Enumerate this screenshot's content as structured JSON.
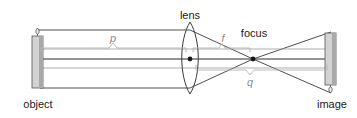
{
  "figure": {
    "type": "optics-ray-diagram",
    "width": 357,
    "height": 118,
    "background_color": "#ffffff"
  },
  "labels": {
    "lens": "lens",
    "focus": "focus",
    "object": "object",
    "image": "image",
    "object_distance": "p",
    "focal_length": "f",
    "image_distance": "q"
  },
  "colors": {
    "ray_line": "#3a3a3a",
    "optical_axis": "#2b2b2b",
    "candle_body_light": "#d9d9d9",
    "candle_body_dark": "#a8a8a8",
    "candle_outline": "#555555",
    "lens_outline": "#3a3a3a",
    "brace_gray": "#b3b3b3",
    "dim_text": "#8c8c8c",
    "label_text": "#1a1a1a",
    "node_dot": "#1a1a1a"
  },
  "geometry": {
    "optical_axis_y": 59,
    "lens_center_x": 190,
    "lens_top_y": 22,
    "lens_bottom_y": 94,
    "focus_x": 253,
    "object_x": 37,
    "object_top_y": 36,
    "object_bottom_y": 88,
    "image_x": 330,
    "image_top_y": 33,
    "image_bottom_y": 85
  },
  "annotations": {
    "object_distance_value": "p",
    "focal_length_value": "f",
    "image_distance_value": "q",
    "description": "Object candle upright at left, converging lens at center, focal point marked, inverted real image at right"
  }
}
